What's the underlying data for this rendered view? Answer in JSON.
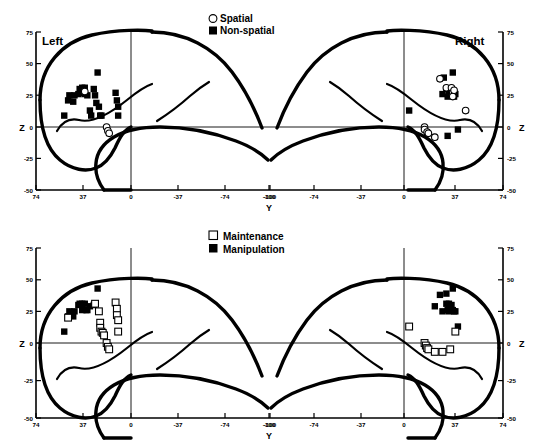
{
  "figure": {
    "name": "glass-brain-coordinate-plots",
    "panel_count": 2
  },
  "axes": {
    "x_label": "Y",
    "y_label": "Z",
    "x_ticks_left": [
      "74",
      "37",
      "0",
      "-37",
      "-74",
      "-100"
    ],
    "x_ticks_right": [
      "-100",
      "-74",
      "-37",
      "0",
      "37",
      "74"
    ],
    "y_ticks": [
      "75",
      "50",
      "25",
      "0",
      "-25",
      "-50"
    ],
    "hemisphere_left": "Left",
    "hemisphere_right": "Right",
    "x_range": [
      74,
      -100
    ],
    "y_range": [
      -50,
      75
    ]
  },
  "panels": [
    {
      "id": "top",
      "legend": [
        {
          "label": "Spatial",
          "marker": "open-circle"
        },
        {
          "label": "Non-spatial",
          "marker": "filled-square"
        }
      ]
    },
    {
      "id": "bottom",
      "legend": [
        {
          "label": "Maintenance",
          "marker": "open-square"
        },
        {
          "label": "Manipulation",
          "marker": "filled-square"
        }
      ]
    }
  ],
  "chart_data": [
    {
      "type": "scatter",
      "title": "",
      "panel": "top",
      "xlabel": "Y",
      "ylabel": "Z",
      "xlim": [
        74,
        -100
      ],
      "ylim": [
        -50,
        75
      ],
      "grid": false,
      "legend_position": "top-center",
      "series": [
        {
          "name": "Non-spatial",
          "marker": "filled-square",
          "hemisphere": "left",
          "points": [
            [
              52,
              9
            ],
            [
              49,
              21
            ],
            [
              48,
              25
            ],
            [
              45,
              20
            ],
            [
              44,
              25
            ],
            [
              41,
              26
            ],
            [
              40,
              30
            ],
            [
              38,
              31
            ],
            [
              38,
              27
            ],
            [
              36,
              31
            ],
            [
              36,
              26
            ],
            [
              34,
              25
            ],
            [
              32,
              13
            ],
            [
              31,
              9
            ],
            [
              29,
              30
            ],
            [
              28,
              25
            ],
            [
              27,
              19
            ],
            [
              26,
              43
            ],
            [
              25,
              16
            ],
            [
              24,
              9
            ],
            [
              23,
              9
            ],
            [
              12,
              27
            ],
            [
              11,
              21
            ],
            [
              10,
              16
            ],
            [
              10,
              9
            ]
          ]
        },
        {
          "name": "Spatial",
          "marker": "open-circle",
          "hemisphere": "left",
          "points": [
            [
              36,
              28
            ],
            [
              19,
              0
            ],
            [
              18,
              -3
            ],
            [
              17,
              -5
            ]
          ]
        },
        {
          "name": "Non-spatial",
          "marker": "filled-square",
          "hemisphere": "right",
          "points": [
            [
              4,
              13
            ],
            [
              31,
              39
            ],
            [
              38,
              43
            ],
            [
              33,
              30
            ],
            [
              35,
              30
            ],
            [
              36,
              29
            ],
            [
              35,
              26
            ],
            [
              34,
              24
            ],
            [
              38,
              26
            ],
            [
              39,
              26
            ],
            [
              39,
              24
            ],
            [
              40,
              26
            ],
            [
              30,
              26
            ],
            [
              42,
              -2
            ],
            [
              34,
              -7
            ]
          ]
        },
        {
          "name": "Spatial",
          "marker": "open-circle",
          "hemisphere": "right",
          "points": [
            [
              28,
              38
            ],
            [
              33,
              31
            ],
            [
              37,
              31
            ],
            [
              38,
              27
            ],
            [
              38,
              24
            ],
            [
              39,
              29
            ],
            [
              48,
              13
            ],
            [
              16,
              0
            ],
            [
              16,
              -2
            ],
            [
              18,
              -4
            ],
            [
              19,
              -5
            ],
            [
              24,
              -8
            ]
          ]
        }
      ]
    },
    {
      "type": "scatter",
      "title": "",
      "panel": "bottom",
      "xlabel": "Y",
      "ylabel": "Z",
      "xlim": [
        74,
        -100
      ],
      "ylim": [
        -50,
        75
      ],
      "grid": false,
      "legend_position": "top-center",
      "series": [
        {
          "name": "Manipulation",
          "marker": "filled-square",
          "hemisphere": "left",
          "points": [
            [
              52,
              9
            ],
            [
              49,
              21
            ],
            [
              48,
              25
            ],
            [
              45,
              21
            ],
            [
              44,
              25
            ],
            [
              41,
              30
            ],
            [
              40,
              31
            ],
            [
              38,
              31
            ],
            [
              38,
              26
            ],
            [
              36,
              31
            ],
            [
              35,
              26
            ],
            [
              34,
              26
            ],
            [
              32,
              29
            ],
            [
              26,
              43
            ],
            [
              29,
              30
            ]
          ]
        },
        {
          "name": "Maintenance",
          "marker": "open-square",
          "hemisphere": "left",
          "points": [
            [
              49,
              20
            ],
            [
              28,
              31
            ],
            [
              25,
              25
            ],
            [
              24,
              16
            ],
            [
              24,
              12
            ],
            [
              23,
              9
            ],
            [
              22,
              8
            ],
            [
              21,
              6
            ],
            [
              12,
              32
            ],
            [
              11,
              27
            ],
            [
              11,
              22
            ],
            [
              10,
              18
            ],
            [
              10,
              9
            ],
            [
              19,
              0
            ],
            [
              18,
              -3
            ],
            [
              17,
              -5
            ]
          ]
        },
        {
          "name": "Manipulation",
          "marker": "filled-square",
          "hemisphere": "right",
          "points": [
            [
              28,
              38
            ],
            [
              33,
              39
            ],
            [
              38,
              43
            ],
            [
              33,
              31
            ],
            [
              35,
              31
            ],
            [
              36,
              29
            ],
            [
              34,
              26
            ],
            [
              35,
              25
            ],
            [
              38,
              26
            ],
            [
              39,
              25
            ],
            [
              40,
              25
            ],
            [
              30,
              25
            ],
            [
              42,
              13
            ],
            [
              24,
              29
            ],
            [
              37,
              30
            ]
          ]
        },
        {
          "name": "Maintenance",
          "marker": "open-square",
          "hemisphere": "right",
          "points": [
            [
              4,
              13
            ],
            [
              40,
              9
            ],
            [
              16,
              0
            ],
            [
              17,
              -2
            ],
            [
              18,
              -4
            ],
            [
              19,
              -5
            ],
            [
              24,
              -7
            ],
            [
              30,
              -7
            ],
            [
              36,
              -5
            ]
          ]
        }
      ]
    }
  ]
}
